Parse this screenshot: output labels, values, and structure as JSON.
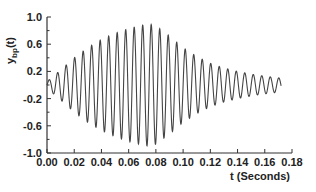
{
  "chart_data": {
    "type": "line",
    "title": "",
    "xlabel": "t (Seconds)",
    "ylabel": "y_bp(t)",
    "ylabel_main": "y",
    "ylabel_sub": "bp",
    "ylabel_suffix": "(t)",
    "xlim": [
      0.0,
      0.18
    ],
    "ylim": [
      -1.0,
      1.0
    ],
    "xticks": [
      "0.00",
      "0.02",
      "0.04",
      "0.06",
      "0.08",
      "0.10",
      "0.12",
      "0.14",
      "0.16",
      "0.18"
    ],
    "yticks": [
      "1.0",
      "0.6",
      "0.2",
      "-0.2",
      "-0.6",
      "-1.0"
    ],
    "grid": false,
    "legend": null,
    "series": [
      {
        "name": "y_bp(t)",
        "description": "Band-pass filtered oscillation (~160 Hz) with amplitude envelope rising from 0 to ~0.9 near t=0.075 s, then decaying to ~0.1 by t=0.172 s",
        "frequency_hz": 160,
        "t_start": 0.0,
        "t_end": 0.172,
        "envelope": {
          "t": [
            0.0,
            0.01,
            0.02,
            0.03,
            0.04,
            0.05,
            0.06,
            0.07,
            0.075,
            0.08,
            0.09,
            0.1,
            0.11,
            0.12,
            0.13,
            0.14,
            0.15,
            0.16,
            0.172
          ],
          "amplitude": [
            0.05,
            0.22,
            0.4,
            0.55,
            0.67,
            0.76,
            0.83,
            0.88,
            0.9,
            0.87,
            0.72,
            0.55,
            0.42,
            0.32,
            0.25,
            0.2,
            0.16,
            0.13,
            0.1
          ]
        }
      }
    ]
  }
}
